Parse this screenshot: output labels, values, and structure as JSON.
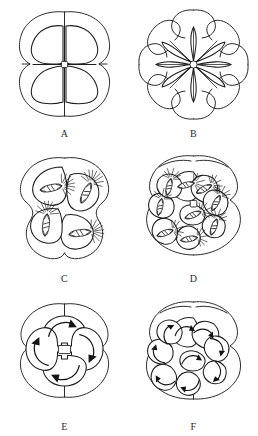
{
  "figure": {
    "background_color": "#ffffff",
    "line_color": "#1d1d1d",
    "panels": [
      {
        "id": "A",
        "label": "A",
        "stage": "4-cell stage",
        "cell_count": 4,
        "features": [
          "outer envelope",
          "four blastomeres",
          "central cross furrow"
        ],
        "has_spindles": false,
        "has_arrows": false
      },
      {
        "id": "B",
        "label": "B",
        "stage": "8-cell stage",
        "cell_count": 8,
        "features": [
          "outer envelope",
          "eight petal blastomeres",
          "radial furrows",
          "central polygon"
        ],
        "has_spindles": false,
        "has_arrows": false
      },
      {
        "id": "C",
        "label": "C",
        "stage": "4-cell stage with mitotic spindles",
        "cell_count": 4,
        "features": [
          "outer envelope",
          "four blastomeres",
          "mitotic spindle",
          "aster"
        ],
        "has_spindles": true,
        "spindle_count": 4,
        "has_arrows": false
      },
      {
        "id": "D",
        "label": "D",
        "stage": "8-cell stage with mitotic spindles",
        "cell_count": 8,
        "features": [
          "outer envelope",
          "eight blastomeres",
          "mitotic spindle",
          "aster",
          "central polygon"
        ],
        "has_spindles": true,
        "spindle_count": 8,
        "has_arrows": false
      },
      {
        "id": "E",
        "label": "E",
        "stage": "4-cell stage with rotation arrows",
        "cell_count": 4,
        "features": [
          "outer envelope",
          "four blastomeres",
          "curved rotation arrows",
          "central square"
        ],
        "has_spindles": false,
        "has_arrows": true,
        "arrow_count": 4
      },
      {
        "id": "F",
        "label": "F",
        "stage": "8-cell stage with rotation arrows",
        "cell_count": 8,
        "features": [
          "outer envelope",
          "eight blastomeres",
          "curved rotation arrows",
          "central polygon"
        ],
        "has_spindles": false,
        "has_arrows": true,
        "arrow_count": 8
      }
    ]
  }
}
